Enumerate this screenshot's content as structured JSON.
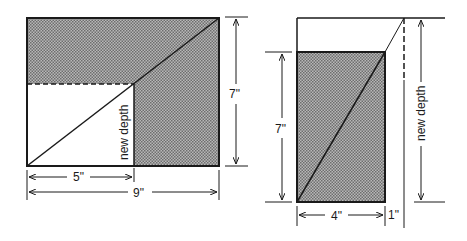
{
  "colors": {
    "ink": "#1a1a1a",
    "shade": "#9a9a9a",
    "paper": "#ffffff"
  },
  "left_figure": {
    "width_label": "9\"",
    "partial_width_label": "5\"",
    "height_label": "7\"",
    "inner_label": "new depth"
  },
  "right_figure": {
    "height_label": "7\"",
    "new_depth_label": "new depth",
    "width_label": "4\"",
    "extension_label": "1\""
  }
}
